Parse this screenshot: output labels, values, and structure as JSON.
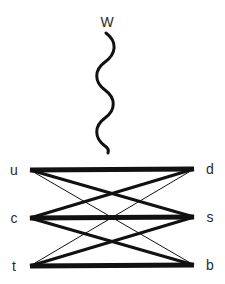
{
  "diagram": {
    "boson": {
      "label": "W",
      "x": 107,
      "y": 22,
      "wave_path": "M 106 33 C 118 42, 116 54, 105 62 C 94 70, 94 82, 105 90 C 116 98, 116 110, 105 118 C 94 126, 94 138, 105 146 C 108 148, 109 150, 108 153"
    },
    "up_type_quarks": [
      {
        "label": "u",
        "x": 14,
        "y": 170
      },
      {
        "label": "c",
        "x": 14,
        "y": 218
      },
      {
        "label": "t",
        "x": 14,
        "y": 266
      }
    ],
    "down_type_quarks": [
      {
        "label": "d",
        "x": 210,
        "y": 169
      },
      {
        "label": "s",
        "x": 210,
        "y": 217
      },
      {
        "label": "b",
        "x": 210,
        "y": 265
      }
    ],
    "couplings": [
      {
        "from": "u",
        "to": "d",
        "x1": 30,
        "y1": 170,
        "x2": 194,
        "y2": 169,
        "width": 5,
        "strength": "strong"
      },
      {
        "from": "u",
        "to": "s",
        "x1": 30,
        "y1": 170,
        "x2": 194,
        "y2": 217,
        "width": 3,
        "strength": "medium"
      },
      {
        "from": "u",
        "to": "b",
        "x1": 30,
        "y1": 170,
        "x2": 194,
        "y2": 265,
        "width": 1,
        "strength": "weak"
      },
      {
        "from": "c",
        "to": "d",
        "x1": 30,
        "y1": 218,
        "x2": 194,
        "y2": 169,
        "width": 3,
        "strength": "medium"
      },
      {
        "from": "c",
        "to": "s",
        "x1": 30,
        "y1": 218,
        "x2": 194,
        "y2": 217,
        "width": 5,
        "strength": "strong"
      },
      {
        "from": "c",
        "to": "b",
        "x1": 30,
        "y1": 218,
        "x2": 194,
        "y2": 265,
        "width": 3,
        "strength": "medium"
      },
      {
        "from": "t",
        "to": "d",
        "x1": 30,
        "y1": 266,
        "x2": 194,
        "y2": 169,
        "width": 1,
        "strength": "weak"
      },
      {
        "from": "t",
        "to": "s",
        "x1": 30,
        "y1": 266,
        "x2": 194,
        "y2": 217,
        "width": 3,
        "strength": "medium"
      },
      {
        "from": "t",
        "to": "b",
        "x1": 30,
        "y1": 266,
        "x2": 194,
        "y2": 265,
        "width": 5,
        "strength": "strong"
      }
    ],
    "colors": {
      "line": "#111111",
      "label": "#2a2a2a",
      "background": "#ffffff"
    }
  }
}
